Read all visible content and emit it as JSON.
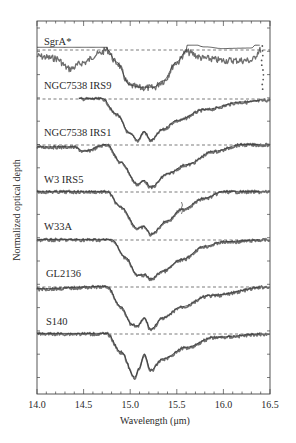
{
  "chart_data": {
    "type": "line",
    "title": "",
    "xlabel": "Wavelength (μm)",
    "ylabel": "Normalized optical depth",
    "xlim": [
      14.0,
      16.5
    ],
    "x_ticks": [
      "14.0",
      "14.5",
      "15.0",
      "15.5",
      "16.0",
      "16.5"
    ],
    "x_minor_step": 0.1,
    "grid": false,
    "legend": "none (spectra labelled inline)",
    "layout": "stacked, vertically offset panels sharing x-axis; dashed zero-baseline for each; data as points/noisy trace with smooth model fit overlaid",
    "series": [
      {
        "name": "SgrA*",
        "baseline_frac": 0.0,
        "x": [
          14.0,
          14.2,
          14.35,
          14.5,
          14.65,
          14.75,
          14.85,
          15.0,
          15.1,
          15.25,
          15.35,
          15.5,
          15.6,
          15.8,
          16.0,
          16.3,
          16.4
        ],
        "depth": [
          0.15,
          0.2,
          0.45,
          0.3,
          0.1,
          0.0,
          0.3,
          0.85,
          0.9,
          0.9,
          0.75,
          0.3,
          0.05,
          0.2,
          0.25,
          0.25,
          0.0
        ],
        "note": "broad 15.2 μm band; extra dip near 14.3 μm; scattered points at 16.4 μm"
      },
      {
        "name": "NGC7538 IRS9",
        "x": [
          14.45,
          14.7,
          14.85,
          15.0,
          15.08,
          15.15,
          15.22,
          15.35,
          15.5,
          15.8,
          16.2,
          16.5
        ],
        "depth": [
          0.0,
          0.0,
          0.35,
          0.8,
          0.95,
          0.75,
          0.95,
          0.7,
          0.5,
          0.25,
          0.08,
          0.03
        ],
        "note": "double-peaked minimum at ~15.08 and ~15.22 μm"
      },
      {
        "name": "NGC7538 IRS1",
        "x": [
          14.0,
          14.4,
          14.5,
          14.75,
          14.9,
          15.08,
          15.15,
          15.22,
          15.4,
          15.6,
          15.9,
          16.2,
          16.5
        ],
        "depth": [
          0.05,
          0.05,
          0.15,
          0.0,
          0.4,
          0.88,
          0.8,
          0.95,
          0.65,
          0.45,
          0.15,
          0.0,
          0.0
        ]
      },
      {
        "name": "W3 IRS5",
        "x": [
          14.0,
          14.75,
          14.9,
          15.08,
          15.15,
          15.22,
          15.4,
          15.55,
          15.8,
          16.0,
          16.5
        ],
        "depth": [
          0.0,
          0.0,
          0.35,
          0.82,
          0.78,
          0.95,
          0.65,
          0.4,
          0.15,
          0.0,
          0.0
        ],
        "note": "spike near 15.55 μm"
      },
      {
        "name": "W33A",
        "x": [
          14.0,
          14.8,
          14.95,
          15.08,
          15.15,
          15.22,
          15.35,
          15.55,
          15.8,
          16.0,
          16.5
        ],
        "depth": [
          0.0,
          0.0,
          0.4,
          0.8,
          0.78,
          0.88,
          0.7,
          0.45,
          0.15,
          0.05,
          0.0
        ]
      },
      {
        "name": "GL2136",
        "x": [
          14.0,
          14.75,
          14.9,
          15.02,
          15.08,
          15.15,
          15.22,
          15.35,
          15.55,
          15.85,
          16.5
        ],
        "depth": [
          0.05,
          0.0,
          0.45,
          0.85,
          0.88,
          0.7,
          0.95,
          0.7,
          0.45,
          0.2,
          0.0
        ]
      },
      {
        "name": "S140",
        "x": [
          14.0,
          14.75,
          14.9,
          15.05,
          15.1,
          15.15,
          15.22,
          15.35,
          15.6,
          15.9,
          16.5
        ],
        "depth": [
          0.0,
          0.0,
          0.4,
          0.95,
          0.75,
          0.45,
          0.8,
          0.55,
          0.3,
          0.08,
          0.0
        ],
        "note": "double minimum at ~15.08 and ~15.22 μm"
      }
    ]
  },
  "axes": {
    "xlabel": "Wavelength (μm)",
    "ylabel": "Normalized optical depth",
    "x_ticks": [
      "14.0",
      "14.5",
      "15.0",
      "15.5",
      "16.0",
      "16.5"
    ]
  },
  "labels": [
    "SgrA*",
    "NGC7538 IRS9",
    "NGC7538 IRS1",
    "W3 IRS5",
    "W33A",
    "GL2136",
    "S140"
  ],
  "colors": {
    "ink": "#2a2a2a",
    "data": "#555555",
    "fit": "#333333",
    "frame": "#444444"
  }
}
